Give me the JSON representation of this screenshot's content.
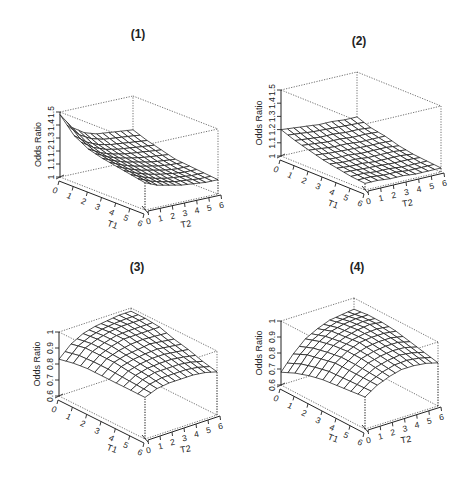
{
  "figure": {
    "width": 469,
    "height": 480,
    "background": "#ffffff",
    "ink_color": "#1a1a1a"
  },
  "chart_data": [
    {
      "type": "surface3d",
      "title": "(1)",
      "xlabel": "T1",
      "ylabel": "T2",
      "zlabel": "Odds Ratio",
      "x_ticks": [
        "0",
        "1",
        "2",
        "3",
        "4",
        "5",
        "6"
      ],
      "y_ticks": [
        "0",
        "1",
        "2",
        "3",
        "4",
        "5",
        "6"
      ],
      "z_ticks": [
        "1",
        "1.1",
        "1.2",
        "1.3",
        "1.4",
        "1.5"
      ],
      "zlim": [
        1.0,
        1.5
      ],
      "grid_on": false,
      "T1": [
        0,
        1,
        2,
        3,
        4,
        5,
        6
      ],
      "T2": [
        0,
        1,
        2,
        3,
        4,
        5,
        6
      ],
      "z": [
        [
          1.48,
          1.36,
          1.3,
          1.27,
          1.26,
          1.25,
          1.24
        ],
        [
          1.36,
          1.29,
          1.25,
          1.23,
          1.22,
          1.21,
          1.2
        ],
        [
          1.3,
          1.25,
          1.22,
          1.2,
          1.19,
          1.18,
          1.17
        ],
        [
          1.27,
          1.23,
          1.2,
          1.18,
          1.16,
          1.15,
          1.14
        ],
        [
          1.25,
          1.21,
          1.18,
          1.16,
          1.14,
          1.13,
          1.13
        ],
        [
          1.23,
          1.19,
          1.16,
          1.14,
          1.13,
          1.12,
          1.12
        ],
        [
          1.21,
          1.17,
          1.15,
          1.13,
          1.12,
          1.11,
          1.11
        ]
      ],
      "layout": {
        "title_pos": [
          138,
          38
        ],
        "origin": [
          60,
          177
        ],
        "front": [
          145,
          210
        ],
        "right": [
          218,
          194
        ],
        "height": 65
      }
    },
    {
      "type": "surface3d",
      "title": "(2)",
      "xlabel": "T1",
      "ylabel": "T2",
      "zlabel": "Odds Ratio",
      "x_ticks": [
        "0",
        "1",
        "2",
        "3",
        "4",
        "5",
        "6"
      ],
      "y_ticks": [
        "0",
        "1",
        "2",
        "3",
        "4",
        "5",
        "6"
      ],
      "z_ticks": [
        "1",
        "1.1",
        "1.2",
        "1.3",
        "1.4",
        "1.5"
      ],
      "zlim": [
        1.0,
        1.5
      ],
      "grid_on": false,
      "T1": [
        0,
        1,
        2,
        3,
        4,
        5,
        6
      ],
      "T2": [
        0,
        1,
        2,
        3,
        4,
        5,
        6
      ],
      "z": [
        [
          1.2,
          1.19,
          1.18,
          1.17,
          1.17,
          1.16,
          1.16
        ],
        [
          1.16,
          1.15,
          1.14,
          1.14,
          1.13,
          1.13,
          1.12
        ],
        [
          1.13,
          1.12,
          1.11,
          1.11,
          1.1,
          1.1,
          1.1
        ],
        [
          1.1,
          1.09,
          1.09,
          1.08,
          1.08,
          1.08,
          1.07
        ],
        [
          1.08,
          1.07,
          1.07,
          1.06,
          1.06,
          1.06,
          1.05
        ],
        [
          1.06,
          1.06,
          1.05,
          1.05,
          1.04,
          1.04,
          1.04
        ],
        [
          1.05,
          1.05,
          1.04,
          1.04,
          1.03,
          1.03,
          1.03
        ]
      ],
      "layout": {
        "title_pos": [
          359,
          45
        ],
        "origin": [
          281,
          156
        ],
        "front": [
          365,
          190
        ],
        "right": [
          441,
          172
        ],
        "height": 66
      }
    },
    {
      "type": "surface3d",
      "title": "(3)",
      "xlabel": "T1",
      "ylabel": "T2",
      "zlabel": "Odds Ratio",
      "x_ticks": [
        "0",
        "1",
        "2",
        "3",
        "4",
        "5",
        "6"
      ],
      "y_ticks": [
        "0",
        "1",
        "2",
        "3",
        "4",
        "5",
        "6"
      ],
      "z_ticks": [
        "0.6",
        "0.7",
        "0.8",
        "0.9",
        "1"
      ],
      "zlim": [
        0.6,
        1.0
      ],
      "grid_on": false,
      "T1": [
        0,
        1,
        2,
        3,
        4,
        5,
        6
      ],
      "T2": [
        0,
        1,
        2,
        3,
        4,
        5,
        6
      ],
      "z": [
        [
          0.83,
          0.9,
          0.94,
          0.96,
          0.97,
          0.98,
          0.98
        ],
        [
          0.85,
          0.92,
          0.95,
          0.97,
          0.98,
          0.98,
          0.98
        ],
        [
          0.86,
          0.92,
          0.95,
          0.97,
          0.97,
          0.97,
          0.97
        ],
        [
          0.86,
          0.92,
          0.94,
          0.95,
          0.96,
          0.95,
          0.94
        ],
        [
          0.86,
          0.91,
          0.93,
          0.94,
          0.94,
          0.93,
          0.92
        ],
        [
          0.86,
          0.9,
          0.92,
          0.92,
          0.92,
          0.91,
          0.89
        ],
        [
          0.86,
          0.89,
          0.9,
          0.9,
          0.9,
          0.89,
          0.87
        ]
      ],
      "layout": {
        "title_pos": [
          137,
          271
        ],
        "origin": [
          59,
          396
        ],
        "front": [
          145,
          439
        ],
        "right": [
          217,
          415
        ],
        "height": 64
      }
    },
    {
      "type": "surface3d",
      "title": "(4)",
      "xlabel": "T1",
      "ylabel": "T2",
      "zlabel": "Odds Ratio",
      "x_ticks": [
        "0",
        "1",
        "2",
        "3",
        "4",
        "5",
        "6"
      ],
      "y_ticks": [
        "0",
        "1",
        "2",
        "3",
        "4",
        "5",
        "6"
      ],
      "z_ticks": [
        "0.6",
        "0.7",
        "0.8",
        "0.9",
        "1"
      ],
      "zlim": [
        0.6,
        1.0
      ],
      "grid_on": false,
      "T1": [
        0,
        1,
        2,
        3,
        4,
        5,
        6
      ],
      "T2": [
        0,
        1,
        2,
        3,
        4,
        5,
        6
      ],
      "z": [
        [
          0.68,
          0.77,
          0.84,
          0.88,
          0.91,
          0.92,
          0.93
        ],
        [
          0.72,
          0.81,
          0.87,
          0.91,
          0.93,
          0.94,
          0.94
        ],
        [
          0.75,
          0.83,
          0.89,
          0.92,
          0.94,
          0.95,
          0.94
        ],
        [
          0.77,
          0.85,
          0.9,
          0.93,
          0.94,
          0.94,
          0.93
        ],
        [
          0.78,
          0.85,
          0.9,
          0.92,
          0.93,
          0.93,
          0.91
        ],
        [
          0.79,
          0.85,
          0.89,
          0.91,
          0.92,
          0.91,
          0.89
        ],
        [
          0.8,
          0.85,
          0.88,
          0.9,
          0.9,
          0.89,
          0.87
        ]
      ],
      "layout": {
        "title_pos": [
          357,
          271
        ],
        "origin": [
          281,
          385
        ],
        "front": [
          365,
          429
        ],
        "right": [
          438,
          406
        ],
        "height": 64
      }
    }
  ]
}
